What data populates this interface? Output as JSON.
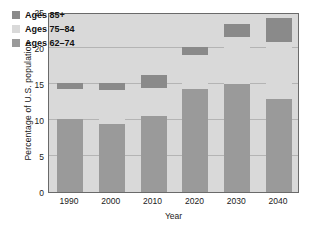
{
  "chart_data": {
    "type": "bar",
    "subtype": "stacked-bar",
    "title": "",
    "xlabel": "Year",
    "ylabel": "Percentage of U.S. population",
    "categories": [
      "1990",
      "2000",
      "2010",
      "2020",
      "2030",
      "2040"
    ],
    "ylim": [
      0,
      25
    ],
    "yticks": [
      0,
      5,
      10,
      15,
      20,
      25
    ],
    "ytick_labels": [
      "0",
      "5",
      "10",
      "15",
      "20",
      "25"
    ],
    "grid": true,
    "grid_axis": "y",
    "legend_position": "upper-left",
    "series": [
      {
        "name": "Ages 62-74",
        "label": "Ages 62–74",
        "color": "#9a9a9a",
        "values": [
          10.2,
          9.5,
          10.5,
          14.3,
          15.0,
          12.9
        ]
      },
      {
        "name": "Ages 75-84",
        "label": "Ages 75–84",
        "color": "#d9d9d9",
        "values": [
          4.1,
          4.6,
          3.9,
          4.7,
          6.5,
          7.9
        ]
      },
      {
        "name": "Ages 85+",
        "label": "Ages 85+",
        "color": "#8a8a8a",
        "values": [
          0.8,
          1.0,
          1.9,
          1.1,
          1.9,
          3.4
        ]
      }
    ],
    "totals": [
      15.1,
      15.1,
      16.3,
      20.1,
      23.4,
      24.2
    ]
  },
  "legend": {
    "items": [
      {
        "label": "Ages 85+",
        "color": "#8a8a8a"
      },
      {
        "label": "Ages 75–84",
        "color": "#d9d9d9"
      },
      {
        "label": "Ages 62–74",
        "color": "#9a9a9a"
      }
    ]
  },
  "colors": {
    "plot_background": "#d9d9d9",
    "gridline": "#b4b4b4",
    "frame": "#6a6a6a",
    "page_background": "#ffffff",
    "text": "#1a1a1a"
  }
}
